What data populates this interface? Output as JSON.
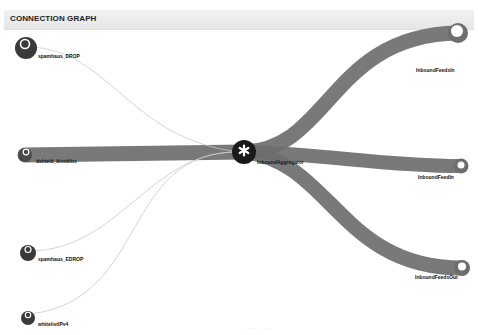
{
  "panel": {
    "title": "CONNECTION GRAPH"
  },
  "colors": {
    "node_dark": "#3a3a3a",
    "node_inner": "#ffffff",
    "flow": "#6e6e6e",
    "thin_link": "#c9c9c9",
    "header_bg": "#ececec"
  },
  "graph": {
    "center": {
      "id": "hub",
      "label": "InboundAggregator",
      "icon": "asterisk-icon"
    },
    "sources": [
      {
        "id": "src1",
        "label": "spamhaus_DROP",
        "link": "thin"
      },
      {
        "id": "src2",
        "label": "dshield_blocklist",
        "link": "thick"
      },
      {
        "id": "src3",
        "label": "spamhaus_EDROP",
        "link": "thin"
      },
      {
        "id": "src4",
        "label": "whitelistIPv4",
        "link": "thin"
      }
    ],
    "targets": [
      {
        "id": "dst1",
        "label": "InboundFeedsIn",
        "link": "thick"
      },
      {
        "id": "dst2",
        "label": "InboundFeedIn",
        "link": "thick"
      },
      {
        "id": "dst3",
        "label": "InboundFeedsOut",
        "link": "thick"
      }
    ]
  },
  "footer": {
    "note": "· · · · · · · · ·"
  }
}
